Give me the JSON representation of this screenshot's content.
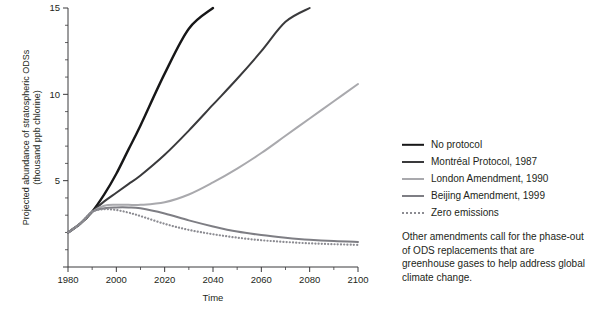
{
  "figure": {
    "background_color": "#ffffff",
    "text_color": "#231f20"
  },
  "axes": {
    "x_title": "Time",
    "y_title_line1": "Projected abundance of stratospheric ODSs",
    "y_title_line2": "(thousand ppb chlorine)",
    "x_ticks": [
      "1980",
      "2000",
      "2020",
      "2040",
      "2060",
      "2080",
      "2100"
    ],
    "y_ticks": [
      "0",
      "5",
      "10",
      "15"
    ]
  },
  "legend": {
    "items": [
      {
        "label": "No protocol",
        "color": "#171718",
        "width": 2.4,
        "dashed": false
      },
      {
        "label": "Montréal Protocol, 1987",
        "color": "#3a3a3c",
        "width": 2.0,
        "dashed": false
      },
      {
        "label": "London Amendment, 1990",
        "color": "#a9a9ad",
        "width": 2.0,
        "dashed": false
      },
      {
        "label": "Beijing Amendment, 1999",
        "color": "#7e7e84",
        "width": 2.0,
        "dashed": false
      },
      {
        "label": "Zero emissions",
        "color": "#8c8c92",
        "width": 2.0,
        "dashed": true
      }
    ],
    "note": "Other amendments call for the phase-out of ODS replacements that are greenhouse gases to help address global climate change."
  },
  "chart_data": {
    "type": "line",
    "title": "",
    "xlabel": "Time",
    "ylabel": "Projected abundance of stratospheric ODSs (thousand ppb chlorine)",
    "xlim": [
      1980,
      2100
    ],
    "ylim": [
      0,
      15
    ],
    "grid": false,
    "legend_position": "right",
    "x": [
      1980,
      1985,
      1990,
      1995,
      2000,
      2005,
      2010,
      2020,
      2030,
      2040,
      2050,
      2060,
      2070,
      2080,
      2090,
      2100
    ],
    "series": [
      {
        "name": "No protocol",
        "color": "#171718",
        "values": [
          2.0,
          2.5,
          3.2,
          4.2,
          5.4,
          6.8,
          8.2,
          11.2,
          13.8,
          15.0,
          null,
          null,
          null,
          null,
          null,
          null
        ]
      },
      {
        "name": "Montréal Protocol, 1987",
        "color": "#3a3a3c",
        "values": [
          2.0,
          2.5,
          3.2,
          3.8,
          4.3,
          4.8,
          5.3,
          6.5,
          7.9,
          9.4,
          10.9,
          12.5,
          14.2,
          15.0,
          null,
          null
        ]
      },
      {
        "name": "London Amendment, 1990",
        "color": "#a9a9ad",
        "values": [
          2.0,
          2.5,
          3.2,
          3.55,
          3.6,
          3.6,
          3.6,
          3.75,
          4.2,
          4.9,
          5.7,
          6.6,
          7.6,
          8.6,
          9.6,
          10.6
        ]
      },
      {
        "name": "Beijing Amendment, 1999",
        "color": "#7e7e84",
        "values": [
          2.0,
          2.5,
          3.2,
          3.4,
          3.45,
          3.45,
          3.4,
          3.1,
          2.7,
          2.35,
          2.05,
          1.85,
          1.7,
          1.58,
          1.5,
          1.45
        ]
      },
      {
        "name": "Zero emissions",
        "color": "#8c8c92",
        "values": [
          2.0,
          2.5,
          3.2,
          3.35,
          3.3,
          3.15,
          2.95,
          2.5,
          2.15,
          1.9,
          1.7,
          1.55,
          1.45,
          1.37,
          1.32,
          1.28
        ]
      }
    ]
  }
}
